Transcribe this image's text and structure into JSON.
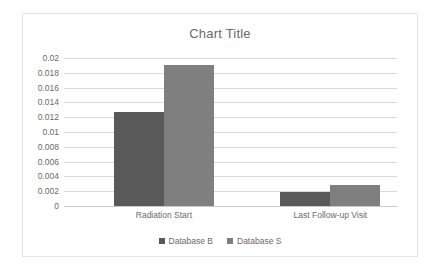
{
  "chart_data": {
    "type": "bar",
    "title": "Chart Title",
    "xlabel": "",
    "ylabel": "",
    "categories": [
      "Radiation Start",
      "Last Follow-up Visit"
    ],
    "series": [
      {
        "name": "Database B",
        "color": "#595959",
        "values": [
          0.0127,
          0.0019
        ]
      },
      {
        "name": "Database S",
        "color": "#7f7f7f",
        "values": [
          0.019,
          0.0029
        ]
      }
    ],
    "ylim": [
      0,
      0.02
    ],
    "y_ticks": [
      0,
      0.002,
      0.004,
      0.006,
      0.008,
      0.01,
      0.012,
      0.014,
      0.016,
      0.018,
      0.02
    ],
    "y_tick_labels": [
      "0",
      "0.002",
      "0.004",
      "0.006",
      "0.008",
      "0.01",
      "0.012",
      "0.014",
      "0.016",
      "0.018",
      "0.02"
    ],
    "grid": true,
    "legend_position": "bottom",
    "bar_group_centers_pct": [
      30,
      80
    ]
  },
  "colors": {
    "series_b": "#595959",
    "series_s": "#7f7f7f",
    "gridline": "#d9d9d9",
    "text": "#6a6a6a",
    "frame": "#e4e4e4",
    "background": "#ffffff"
  }
}
